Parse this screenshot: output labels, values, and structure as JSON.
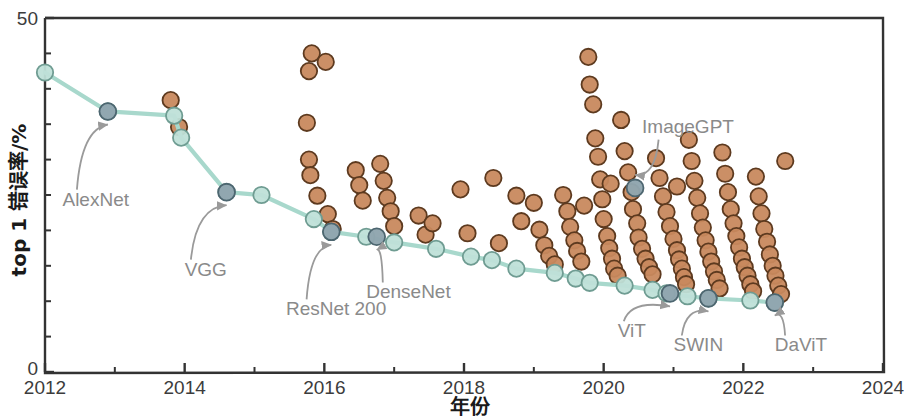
{
  "chart_data": {
    "type": "scatter",
    "title": "",
    "xlabel": "年份",
    "ylabel": "top 1 错误率/%",
    "xlim": [
      2012,
      2024
    ],
    "ylim": [
      0,
      50
    ],
    "xticks": [
      2012,
      2014,
      2016,
      2018,
      2020,
      2022,
      2024
    ],
    "xticklabels": [
      "2012",
      "2014",
      "2016",
      "2018",
      "2020",
      "2022",
      "2024"
    ],
    "x_minor_ticks": [
      2013,
      2015,
      2017,
      2019,
      2021,
      2023
    ],
    "yticks": [
      0,
      50
    ],
    "yticklabels": [
      "0",
      "50"
    ],
    "y_minor_ticks": [
      5,
      10,
      15,
      20,
      25,
      30,
      35,
      40,
      45
    ],
    "grid": false,
    "legend_position": "none",
    "colors": {
      "frontier_line": "#a8d8cc",
      "frontier_marker_fill": "#bfe0d8",
      "frontier_marker_edge": "#6f9c92",
      "highlight_marker_fill": "#8fa5ae",
      "highlight_marker_edge": "#4d6670",
      "population_marker_fill": "#c8895e",
      "population_marker_edge": "#5d3a1f",
      "axis": "#333333",
      "annotation_text": "#8a8a8a"
    },
    "series": [
      {
        "name": "SOTA frontier (top-1 error)",
        "type": "line",
        "marker": "circle",
        "points": [
          {
            "x": 2012.0,
            "y": 42.3
          },
          {
            "x": 2012.9,
            "y": 36.8
          },
          {
            "x": 2013.85,
            "y": 36.2
          },
          {
            "x": 2013.95,
            "y": 33.1
          },
          {
            "x": 2014.6,
            "y": 25.4
          },
          {
            "x": 2015.1,
            "y": 25.0
          },
          {
            "x": 2015.85,
            "y": 21.6
          },
          {
            "x": 2016.1,
            "y": 19.8
          },
          {
            "x": 2016.6,
            "y": 19.1
          },
          {
            "x": 2017.0,
            "y": 18.3
          },
          {
            "x": 2017.6,
            "y": 17.4
          },
          {
            "x": 2018.1,
            "y": 16.3
          },
          {
            "x": 2018.4,
            "y": 15.8
          },
          {
            "x": 2018.75,
            "y": 14.6
          },
          {
            "x": 2019.3,
            "y": 14.0
          },
          {
            "x": 2019.6,
            "y": 13.2
          },
          {
            "x": 2019.8,
            "y": 12.6
          },
          {
            "x": 2020.3,
            "y": 12.2
          },
          {
            "x": 2020.7,
            "y": 11.6
          },
          {
            "x": 2020.9,
            "y": 11.1
          },
          {
            "x": 2021.2,
            "y": 10.7
          },
          {
            "x": 2021.5,
            "y": 10.4
          },
          {
            "x": 2022.1,
            "y": 10.1
          },
          {
            "x": 2022.45,
            "y": 9.8
          }
        ]
      },
      {
        "name": "Published models (population)",
        "type": "scatter",
        "marker": "circle"
      }
    ],
    "annotations": [
      {
        "label": "AlexNet",
        "point": [
          2012.9,
          36.8
        ],
        "text_xy": [
          2012.25,
          23.5
        ],
        "marker_highlight": true
      },
      {
        "label": "VGG",
        "point": [
          2014.6,
          25.4
        ],
        "text_xy": [
          2014.0,
          13.6
        ],
        "marker_highlight": true
      },
      {
        "label": "ResNet 200",
        "point": [
          2016.1,
          19.8
        ],
        "text_xy": [
          2015.45,
          8.0
        ],
        "marker_highlight": true
      },
      {
        "label": "DenseNet",
        "point": [
          2016.75,
          19.1
        ],
        "text_xy": [
          2016.6,
          10.4
        ],
        "marker_highlight": true
      },
      {
        "label": "ImageGPT",
        "point": [
          2020.45,
          26.0
        ],
        "text_xy": [
          2020.55,
          33.8
        ],
        "marker_highlight": true
      },
      {
        "label": "ViT",
        "point": [
          2020.95,
          11.1
        ],
        "text_xy": [
          2020.2,
          4.9
        ],
        "marker_highlight": true
      },
      {
        "label": "SWIN",
        "point": [
          2021.5,
          10.4
        ],
        "text_xy": [
          2021.0,
          2.9
        ],
        "marker_highlight": true
      },
      {
        "label": "DaViT",
        "point": [
          2022.45,
          9.8
        ],
        "text_xy": [
          2022.45,
          2.9
        ],
        "marker_highlight": true
      }
    ],
    "population_points": [
      {
        "x": 2013.8,
        "y": 38.4
      },
      {
        "x": 2013.92,
        "y": 34.6
      },
      {
        "x": 2015.78,
        "y": 42.5
      },
      {
        "x": 2015.82,
        "y": 45.0
      },
      {
        "x": 2016.02,
        "y": 43.8
      },
      {
        "x": 2015.75,
        "y": 35.2
      },
      {
        "x": 2015.78,
        "y": 30.0
      },
      {
        "x": 2015.8,
        "y": 27.8
      },
      {
        "x": 2015.9,
        "y": 24.9
      },
      {
        "x": 2016.05,
        "y": 22.3
      },
      {
        "x": 2016.12,
        "y": 20.2
      },
      {
        "x": 2016.45,
        "y": 28.5
      },
      {
        "x": 2016.5,
        "y": 26.4
      },
      {
        "x": 2016.55,
        "y": 24.2
      },
      {
        "x": 2016.8,
        "y": 29.4
      },
      {
        "x": 2016.85,
        "y": 27.0
      },
      {
        "x": 2016.9,
        "y": 24.6
      },
      {
        "x": 2016.95,
        "y": 22.7
      },
      {
        "x": 2017.0,
        "y": 20.6
      },
      {
        "x": 2017.35,
        "y": 22.1
      },
      {
        "x": 2017.45,
        "y": 19.4
      },
      {
        "x": 2017.55,
        "y": 21.0
      },
      {
        "x": 2017.95,
        "y": 25.8
      },
      {
        "x": 2018.05,
        "y": 19.6
      },
      {
        "x": 2018.42,
        "y": 27.4
      },
      {
        "x": 2018.5,
        "y": 18.2
      },
      {
        "x": 2018.75,
        "y": 24.9
      },
      {
        "x": 2018.82,
        "y": 21.3
      },
      {
        "x": 2019.0,
        "y": 23.9
      },
      {
        "x": 2019.08,
        "y": 20.1
      },
      {
        "x": 2019.15,
        "y": 17.9
      },
      {
        "x": 2019.22,
        "y": 16.4
      },
      {
        "x": 2019.3,
        "y": 15.2
      },
      {
        "x": 2019.42,
        "y": 25.0
      },
      {
        "x": 2019.48,
        "y": 22.7
      },
      {
        "x": 2019.52,
        "y": 20.5
      },
      {
        "x": 2019.58,
        "y": 18.6
      },
      {
        "x": 2019.62,
        "y": 17.1
      },
      {
        "x": 2019.68,
        "y": 15.6
      },
      {
        "x": 2019.72,
        "y": 23.5
      },
      {
        "x": 2019.78,
        "y": 44.5
      },
      {
        "x": 2019.8,
        "y": 40.6
      },
      {
        "x": 2019.85,
        "y": 37.8
      },
      {
        "x": 2019.88,
        "y": 33.0
      },
      {
        "x": 2019.92,
        "y": 30.4
      },
      {
        "x": 2019.95,
        "y": 27.2
      },
      {
        "x": 2019.98,
        "y": 24.4
      },
      {
        "x": 2020.0,
        "y": 21.6
      },
      {
        "x": 2020.05,
        "y": 19.2
      },
      {
        "x": 2020.08,
        "y": 17.5
      },
      {
        "x": 2020.12,
        "y": 16.0
      },
      {
        "x": 2020.15,
        "y": 14.6
      },
      {
        "x": 2020.2,
        "y": 13.6
      },
      {
        "x": 2020.25,
        "y": 35.6
      },
      {
        "x": 2020.3,
        "y": 31.2
      },
      {
        "x": 2020.35,
        "y": 28.2
      },
      {
        "x": 2020.4,
        "y": 25.4
      },
      {
        "x": 2020.42,
        "y": 23.0
      },
      {
        "x": 2020.48,
        "y": 21.0
      },
      {
        "x": 2020.5,
        "y": 19.0
      },
      {
        "x": 2020.55,
        "y": 17.4
      },
      {
        "x": 2020.6,
        "y": 16.0
      },
      {
        "x": 2020.65,
        "y": 14.8
      },
      {
        "x": 2020.7,
        "y": 13.8
      },
      {
        "x": 2020.75,
        "y": 30.2
      },
      {
        "x": 2020.8,
        "y": 27.4
      },
      {
        "x": 2020.85,
        "y": 24.8
      },
      {
        "x": 2020.9,
        "y": 22.6
      },
      {
        "x": 2020.95,
        "y": 20.6
      },
      {
        "x": 2021.0,
        "y": 18.8
      },
      {
        "x": 2021.05,
        "y": 17.2
      },
      {
        "x": 2021.08,
        "y": 15.9
      },
      {
        "x": 2021.12,
        "y": 14.6
      },
      {
        "x": 2021.15,
        "y": 13.4
      },
      {
        "x": 2021.18,
        "y": 12.4
      },
      {
        "x": 2021.22,
        "y": 32.8
      },
      {
        "x": 2021.26,
        "y": 29.8
      },
      {
        "x": 2021.3,
        "y": 27.0
      },
      {
        "x": 2021.34,
        "y": 24.6
      },
      {
        "x": 2021.38,
        "y": 22.4
      },
      {
        "x": 2021.42,
        "y": 20.4
      },
      {
        "x": 2021.46,
        "y": 18.6
      },
      {
        "x": 2021.5,
        "y": 17.0
      },
      {
        "x": 2021.54,
        "y": 15.6
      },
      {
        "x": 2021.58,
        "y": 14.2
      },
      {
        "x": 2021.62,
        "y": 13.0
      },
      {
        "x": 2021.66,
        "y": 11.8
      },
      {
        "x": 2021.7,
        "y": 31.0
      },
      {
        "x": 2021.74,
        "y": 28.0
      },
      {
        "x": 2021.78,
        "y": 25.4
      },
      {
        "x": 2021.82,
        "y": 23.0
      },
      {
        "x": 2021.86,
        "y": 21.0
      },
      {
        "x": 2021.9,
        "y": 19.2
      },
      {
        "x": 2021.94,
        "y": 17.6
      },
      {
        "x": 2021.98,
        "y": 16.0
      },
      {
        "x": 2022.02,
        "y": 14.8
      },
      {
        "x": 2022.06,
        "y": 13.6
      },
      {
        "x": 2022.1,
        "y": 12.4
      },
      {
        "x": 2022.14,
        "y": 11.4
      },
      {
        "x": 2022.18,
        "y": 27.6
      },
      {
        "x": 2022.22,
        "y": 24.8
      },
      {
        "x": 2022.26,
        "y": 22.4
      },
      {
        "x": 2022.3,
        "y": 20.2
      },
      {
        "x": 2022.34,
        "y": 18.4
      },
      {
        "x": 2022.38,
        "y": 16.6
      },
      {
        "x": 2022.42,
        "y": 15.0
      },
      {
        "x": 2022.46,
        "y": 13.6
      },
      {
        "x": 2022.5,
        "y": 12.2
      },
      {
        "x": 2022.54,
        "y": 11.0
      },
      {
        "x": 2022.6,
        "y": 29.8
      },
      {
        "x": 2020.1,
        "y": 26.6
      },
      {
        "x": 2021.05,
        "y": 26.2
      }
    ]
  },
  "figure": {
    "axis_y_max_label": "50",
    "axis_y_min_label": "0"
  }
}
